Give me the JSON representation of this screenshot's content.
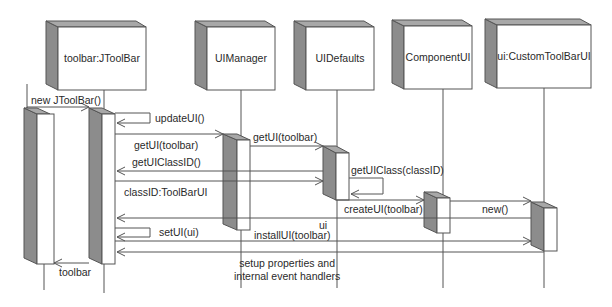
{
  "diagram": {
    "type": "UML sequence diagram",
    "colors": {
      "line": "#555555",
      "box_face": "#ffffff",
      "box_side": "#8c8c8c",
      "box_top": "#a8a8a8",
      "text": "#2a2a2a"
    },
    "objects": [
      {
        "id": "toolbar",
        "label": "toolbar:JToolBar"
      },
      {
        "id": "uimanager",
        "label": "UIManager"
      },
      {
        "id": "uidefaults",
        "label": "UIDefaults"
      },
      {
        "id": "componentui",
        "label": "ComponentUI"
      },
      {
        "id": "customtoolbarui",
        "label": "ui:CustomToolBarUI"
      }
    ],
    "messages": [
      {
        "label": "new JToolBar()",
        "from": "client",
        "to": "toolbar"
      },
      {
        "label": "updateUI()",
        "from": "toolbar",
        "to": "toolbar"
      },
      {
        "label": "getUI(toolbar)",
        "from": "toolbar",
        "to": "uimanager"
      },
      {
        "label": "getUI(toolbar)",
        "from": "uimanager",
        "to": "uidefaults"
      },
      {
        "label": "getUIClassID()",
        "from": "uidefaults",
        "to": "toolbar"
      },
      {
        "label": "classID:ToolBarUI",
        "from": "toolbar",
        "to": "uidefaults"
      },
      {
        "label": "getUIClass(classID)",
        "from": "uidefaults",
        "to": "uidefaults"
      },
      {
        "label": "createUI(toolbar)",
        "from": "uidefaults",
        "to": "componentui"
      },
      {
        "label": "new()",
        "from": "componentui",
        "to": "customtoolbarui"
      },
      {
        "label": "ui",
        "from": "customtoolbarui",
        "to": "toolbar"
      },
      {
        "label": "setUI(ui)",
        "from": "toolbar",
        "to": "toolbar"
      },
      {
        "label": "installUI(toolbar)",
        "from": "toolbar",
        "to": "customtoolbarui"
      },
      {
        "label": "",
        "from": "customtoolbarui",
        "to": "toolbar"
      },
      {
        "label": "toolbar",
        "from": "toolbar",
        "to": "client"
      }
    ],
    "notes": [
      {
        "line1": "setup properties and",
        "line2": "internal event handlers"
      }
    ]
  }
}
